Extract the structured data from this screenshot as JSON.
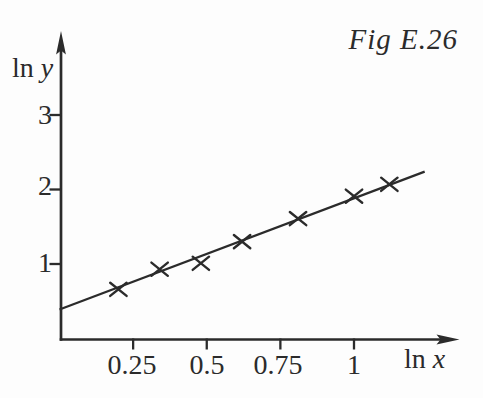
{
  "figure": {
    "label": "Fig E.26",
    "y_axis_label": {
      "prefix": "ln",
      "variable": "y"
    },
    "x_axis_label": {
      "prefix": "ln",
      "variable": "x"
    }
  },
  "chart_data": {
    "type": "scatter",
    "title": "Fig E.26",
    "xlabel": "ln x",
    "ylabel": "ln y",
    "marker": "x",
    "grid": false,
    "legend": "none",
    "xlim": [
      0,
      1.35
    ],
    "ylim": [
      0,
      4.05
    ],
    "x_ticks": [
      0.25,
      0.5,
      0.75,
      1
    ],
    "x_tick_labels": [
      "0.25",
      "0.5",
      "0.75",
      "1"
    ],
    "y_ticks": [
      1,
      2,
      3
    ],
    "y_tick_labels": [
      "1",
      "2",
      "3"
    ],
    "points": [
      {
        "x": 0.2,
        "y": 0.66
      },
      {
        "x": 0.34,
        "y": 0.93
      },
      {
        "x": 0.48,
        "y": 1.01
      },
      {
        "x": 0.62,
        "y": 1.3
      },
      {
        "x": 0.81,
        "y": 1.61
      },
      {
        "x": 1.0,
        "y": 1.91
      },
      {
        "x": 1.12,
        "y": 2.07
      }
    ],
    "fit_line": {
      "x1": 0.0,
      "y1": 0.39,
      "x2": 1.24,
      "y2": 2.24,
      "slope": 1.5,
      "intercept": 0.39
    },
    "ink_color": "#2b2b2b",
    "background": "#fdfdfd"
  }
}
